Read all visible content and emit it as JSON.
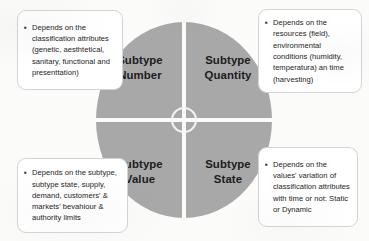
{
  "diagram": {
    "accent_gray": "#a8a8a8",
    "background": "#fbfbf9",
    "border_color": "#d4d4d4",
    "bullet_glyph": "▪",
    "quadrants": [
      {
        "id": "number",
        "line1": "Subtype",
        "line2": "Number"
      },
      {
        "id": "quantity",
        "line1": "Subtype",
        "line2": "Quantity"
      },
      {
        "id": "value",
        "line1": "Subtype",
        "line2": "Value"
      },
      {
        "id": "state",
        "line1": "Subtype",
        "line2": "State"
      }
    ],
    "callouts": [
      {
        "id": "classification",
        "position": "top-left",
        "text": "Depends on the classification attributes (genetic, aesthtetical, sanitary, functional and presenttation)"
      },
      {
        "id": "resources",
        "position": "top-right",
        "text": "Depends on the resources (field), environmental conditions (humidity, temperatura) an time (harvesting)"
      },
      {
        "id": "market",
        "position": "bottom-left",
        "text": "Depends on the subtype, subtype state, supply, demand, customers' & markets' bevahiour & authority limits"
      },
      {
        "id": "variation",
        "position": "bottom-right",
        "text": "Depends on the values' variation of classification attributes with time or not: Static or Dynamic"
      }
    ]
  }
}
